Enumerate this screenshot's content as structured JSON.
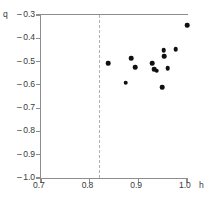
{
  "chart_data": {
    "type": "scatter",
    "title": "",
    "subtitle": "",
    "xlabel": "h",
    "ylabel": "q",
    "xlim": [
      0.7,
      1.0
    ],
    "ylim": [
      -1.0,
      -0.3
    ],
    "xticks": [
      0.7,
      0.8,
      0.9,
      1.0
    ],
    "yticks": [
      -0.3,
      -0.4,
      -0.5,
      -0.6,
      -0.7,
      -0.8,
      -0.9,
      -1.0
    ],
    "xticklabels": [
      "0.7",
      "0.8",
      "0.9",
      "1.0"
    ],
    "yticklabels": [
      "-0.3",
      "-0.4",
      "-0.5",
      "-0.6",
      "-0.7",
      "-0.8",
      "-0.9",
      "-1.0"
    ],
    "grid": false,
    "legend": null,
    "marker": "filled-circle",
    "marker_color": "#101010",
    "annotations": [
      {
        "type": "vline",
        "x": 0.82,
        "style": "dashed",
        "color": "#b0b0b0",
        "label": ""
      }
    ],
    "series": [
      {
        "name": "q",
        "points": [
          {
            "x": 0.838,
            "y": -0.507
          },
          {
            "x": 0.874,
            "y": -0.591
          },
          {
            "x": 0.885,
            "y": -0.485
          },
          {
            "x": 0.894,
            "y": -0.524
          },
          {
            "x": 0.929,
            "y": -0.506
          },
          {
            "x": 0.932,
            "y": -0.534
          },
          {
            "x": 0.938,
            "y": -0.539
          },
          {
            "x": 0.949,
            "y": -0.61
          },
          {
            "x": 0.952,
            "y": -0.452
          },
          {
            "x": 0.953,
            "y": -0.477
          },
          {
            "x": 0.96,
            "y": -0.528
          },
          {
            "x": 0.977,
            "y": -0.446
          },
          {
            "x": 1.0,
            "y": -0.344
          }
        ]
      }
    ]
  },
  "axes": {
    "y_axis_name": "q",
    "x_axis_unit": "h"
  }
}
